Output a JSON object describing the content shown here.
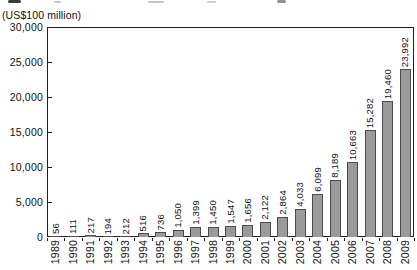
{
  "chart_data": {
    "type": "bar",
    "unit_label": "(US$100 million)",
    "categories": [
      "1989",
      "1990",
      "1991",
      "1992",
      "1993",
      "1994",
      "1995",
      "1996",
      "1997",
      "1998",
      "1999",
      "2000",
      "2001",
      "2002",
      "2003",
      "2004",
      "2005",
      "2006",
      "2007",
      "2008",
      "2009"
    ],
    "values": [
      56,
      111,
      217,
      194,
      212,
      516,
      736,
      1050,
      1399,
      1450,
      1547,
      1656,
      2122,
      2864,
      4033,
      6099,
      8189,
      10663,
      15282,
      19460,
      23992
    ],
    "value_labels": [
      "56",
      "111",
      "217",
      "194",
      "212",
      "516",
      "736",
      "1,050",
      "1,399",
      "1,450",
      "1,547",
      "1,656",
      "2,122",
      "2,864",
      "4,033",
      "6,099",
      "8,189",
      "10,663",
      "15,282",
      "19,460",
      "23,992"
    ],
    "ylim": [
      0,
      30000
    ],
    "ytick_interval": 5000,
    "ytick_labels": [
      "0",
      "5,000",
      "10,000",
      "15,000",
      "20,000",
      "25,000",
      "30,000"
    ],
    "grid": false,
    "legend": false,
    "value_label_rotation": 90,
    "x_label_rotation": 90,
    "bar_color": "#9a9a9a",
    "bar_border_color": "#4c4c4c",
    "axis_color": "#1f1f1f",
    "text_color": "#111111"
  }
}
